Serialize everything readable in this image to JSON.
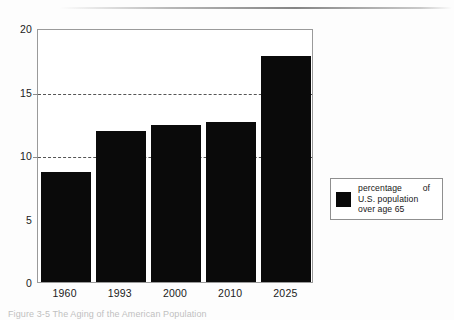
{
  "figure": {
    "caption": "Figure 3-5 The Aging of the American Population"
  },
  "legend": {
    "entries": [
      {
        "swatch_color": "#080808",
        "line1": "percentage of",
        "line2": "U.S. population",
        "line3": "over age 65"
      }
    ]
  },
  "colors": {
    "bar": "#0a0a0a",
    "axis": "#9a9a9a",
    "gridline": "#555555",
    "text": "#1b1b1b",
    "background": "#fdfdfd"
  },
  "chart_data": {
    "type": "bar",
    "title": "",
    "xlabel": "",
    "ylabel": "",
    "categories": [
      "1960",
      "1993",
      "2000",
      "2010",
      "2025"
    ],
    "values": [
      8.7,
      11.9,
      12.4,
      12.6,
      17.8
    ],
    "series": [
      {
        "name": "percentage of U.S. population over age 65",
        "values": [
          8.7,
          11.9,
          12.4,
          12.6,
          17.8
        ]
      }
    ],
    "ylim": [
      0,
      20
    ],
    "yticks": [
      0,
      5,
      10,
      15,
      20
    ],
    "ytick_labels": [
      "0",
      "5",
      "10",
      "15",
      "20"
    ],
    "gridlines": [
      10,
      15
    ],
    "grid": true,
    "legend_position": "right-outside"
  }
}
